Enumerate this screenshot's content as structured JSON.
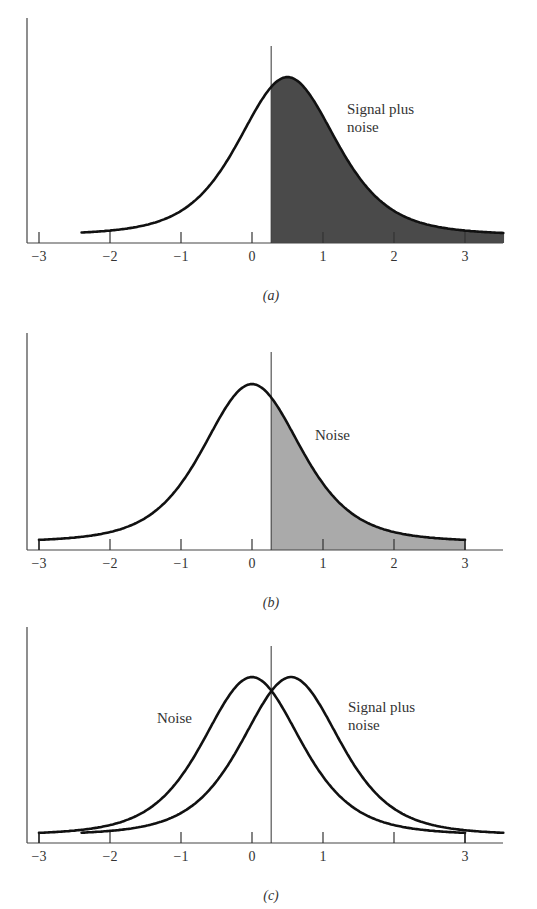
{
  "figure": {
    "panels": [
      {
        "id": "a",
        "caption": "(a)",
        "tick_labels": [
          "−3",
          "−2",
          "−1",
          "0",
          "1",
          "2",
          "3"
        ],
        "curve_labels": [
          {
            "text": "Signal plus",
            "x": 347,
            "y": 100
          },
          {
            "text": "noise",
            "x": 347,
            "y": 118
          }
        ]
      },
      {
        "id": "b",
        "caption": "(b)",
        "tick_labels": [
          "−3",
          "−2",
          "−1",
          "0",
          "1",
          "2",
          "3"
        ],
        "curve_labels": [
          {
            "text": "Noise",
            "x": 315,
            "y": 426
          }
        ]
      },
      {
        "id": "c",
        "caption": "(c)",
        "tick_labels": [
          "−3",
          "−2",
          "−1",
          "0",
          "1",
          "",
          "3"
        ],
        "curve_labels": [
          {
            "text": "Noise",
            "x": 157,
            "y": 709
          },
          {
            "text": "Signal plus",
            "x": 348,
            "y": 698
          },
          {
            "text": "noise",
            "x": 348,
            "y": 716
          }
        ]
      }
    ]
  },
  "chart_data": [
    {
      "type": "area",
      "title": "(a) Signal plus noise distribution with criterion",
      "xlabel": "",
      "ylabel": "",
      "x_ticks": [
        -3,
        -2,
        -1,
        0,
        1,
        2,
        3
      ],
      "xlim": [
        -3.2,
        3.55
      ],
      "series": [
        {
          "name": "Signal plus noise",
          "mean": 0.5,
          "x_range": [
            -2.4,
            3.55
          ],
          "shaded_from": 0.27,
          "shade_color": "#4a4a4a"
        }
      ],
      "criterion_x": 0.27,
      "annotations": [
        "Signal plus noise"
      ],
      "grid": false
    },
    {
      "type": "area",
      "title": "(b) Noise distribution with criterion",
      "xlabel": "",
      "ylabel": "",
      "x_ticks": [
        -3,
        -2,
        -1,
        0,
        1,
        2,
        3
      ],
      "xlim": [
        -3.2,
        3.55
      ],
      "series": [
        {
          "name": "Noise",
          "mean": 0.0,
          "x_range": [
            -3,
            3
          ],
          "shaded_from": 0.27,
          "shade_color": "#aaaaaa"
        }
      ],
      "criterion_x": 0.27,
      "annotations": [
        "Noise"
      ],
      "grid": false
    },
    {
      "type": "line",
      "title": "(c) Noise and signal plus noise distributions overlapping",
      "xlabel": "",
      "ylabel": "",
      "x_ticks": [
        -3,
        -2,
        -1,
        0,
        1,
        2,
        3
      ],
      "x_tick_labels": [
        "−3",
        "−2",
        "−1",
        "0",
        "1",
        "",
        "3"
      ],
      "xlim": [
        -3.2,
        3.55
      ],
      "series": [
        {
          "name": "Noise",
          "mean": 0.0,
          "x_range": [
            -3,
            3
          ]
        },
        {
          "name": "Signal plus noise",
          "mean": 0.55,
          "x_range": [
            -2.4,
            3.55
          ]
        }
      ],
      "criterion_x": 0.27,
      "annotations": [
        "Noise",
        "Signal plus noise"
      ],
      "grid": false
    }
  ],
  "layout": {
    "x0_px": 252,
    "unit_px": 71,
    "axis_left_px": 27,
    "axis_right_px": 503,
    "panels": [
      {
        "baseline": 243,
        "axis_top": 18,
        "crit_top": 46,
        "peak_px": 166
      },
      {
        "baseline": 550,
        "axis_top": 333,
        "crit_top": 352,
        "peak_px": 166
      },
      {
        "baseline": 843,
        "axis_top": 627,
        "crit_top": 646,
        "peak_px": 166
      }
    ]
  }
}
